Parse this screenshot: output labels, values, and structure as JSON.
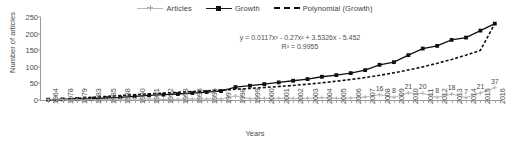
{
  "chart_data": {
    "type": "line",
    "title": "",
    "xlabel": "Years",
    "ylabel": "Number of articles",
    "ylim": [
      0,
      250
    ],
    "yticks": [
      0,
      50,
      100,
      150,
      200,
      250
    ],
    "grid": false,
    "legend_position": "top-center",
    "categories": [
      "1964",
      "1978",
      "1979",
      "1983",
      "1985",
      "1988",
      "1990",
      "1991",
      "1992",
      "1993",
      "1995",
      "1996",
      "1997",
      "1998",
      "1999",
      "2000",
      "2001",
      "2002",
      "2003",
      "2004",
      "2005",
      "2006",
      "2007",
      "2008",
      "2009",
      "2010",
      "2011",
      "2012",
      "2013",
      "2014",
      "2015",
      "2016"
    ],
    "series": [
      {
        "name": "Articles",
        "style": "line-marker",
        "color": "#b0b0b0",
        "marker": "cross",
        "values": [
          1,
          1,
          1,
          1,
          2,
          2,
          3,
          3,
          2,
          2,
          3,
          3,
          3,
          12,
          4,
          5,
          5,
          5,
          5,
          7,
          5,
          6,
          9,
          16,
          8,
          21,
          20,
          8,
          18,
          7,
          21,
          37
        ],
        "labels": {
          "2008": "16",
          "2009": "8",
          "2010": "21",
          "2011": "20",
          "2012": "8",
          "2013": "18",
          "2014": "7",
          "2015": "21",
          "2016": "37"
        }
      },
      {
        "name": "Growth",
        "style": "line-marker",
        "color": "#111111",
        "marker": "square",
        "values": [
          1,
          2,
          3,
          4,
          6,
          8,
          11,
          14,
          16,
          18,
          21,
          24,
          27,
          39,
          43,
          48,
          53,
          58,
          63,
          70,
          75,
          81,
          90,
          106,
          114,
          135,
          155,
          163,
          181,
          188,
          209,
          230
        ]
      },
      {
        "name": "Polynomial (Growth)",
        "style": "dashed-trendline",
        "color": "#111111",
        "values": [
          -2.1,
          1.4,
          4.7,
          7.8,
          10.7,
          13.4,
          16.0,
          18.4,
          20.8,
          23.1,
          25.3,
          27.6,
          29.9,
          32.3,
          34.8,
          37.6,
          40.6,
          43.9,
          47.6,
          51.8,
          56.5,
          61.7,
          67.7,
          74.4,
          81.9,
          90.4,
          99.8,
          110.4,
          122.1,
          135.1,
          149.5,
          230.0
        ]
      }
    ],
    "annotations": {
      "equation": "y = 0.0117x³ - 0.27x² + 3.5326x - 5.452",
      "r_squared": "R² = 0.9955"
    }
  },
  "legend": {
    "items": [
      {
        "label": "Articles"
      },
      {
        "label": "Growth"
      },
      {
        "label": "Polynomial (Growth)"
      }
    ]
  }
}
